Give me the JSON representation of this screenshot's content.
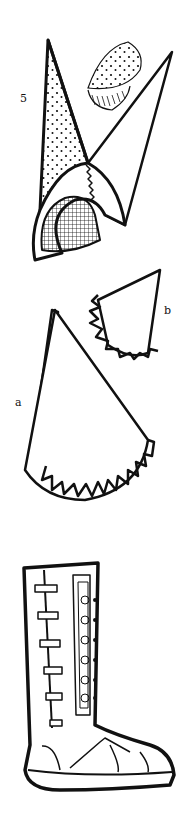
{
  "figure": {
    "figure_number": "5",
    "labels": {
      "a": "a",
      "b": "b"
    },
    "parts": [
      {
        "id": "hat-assembled",
        "description": "Tall pointed hat with dotted lining, mesh face opening and ruffled edge"
      },
      {
        "id": "cap-fragment",
        "description": "Small dotted cap fragment with hatched fringe"
      },
      {
        "id": "piece-a",
        "description": "Large fan-shaped pattern piece with ruffled curved edge"
      },
      {
        "id": "piece-b",
        "description": "Smaller triangular pattern piece with ruffled edge"
      },
      {
        "id": "boot",
        "description": "Tall laced sandal boot with spiral decorations"
      }
    ],
    "colors": {
      "ink": "#111111",
      "paper": "#ffffff"
    }
  }
}
